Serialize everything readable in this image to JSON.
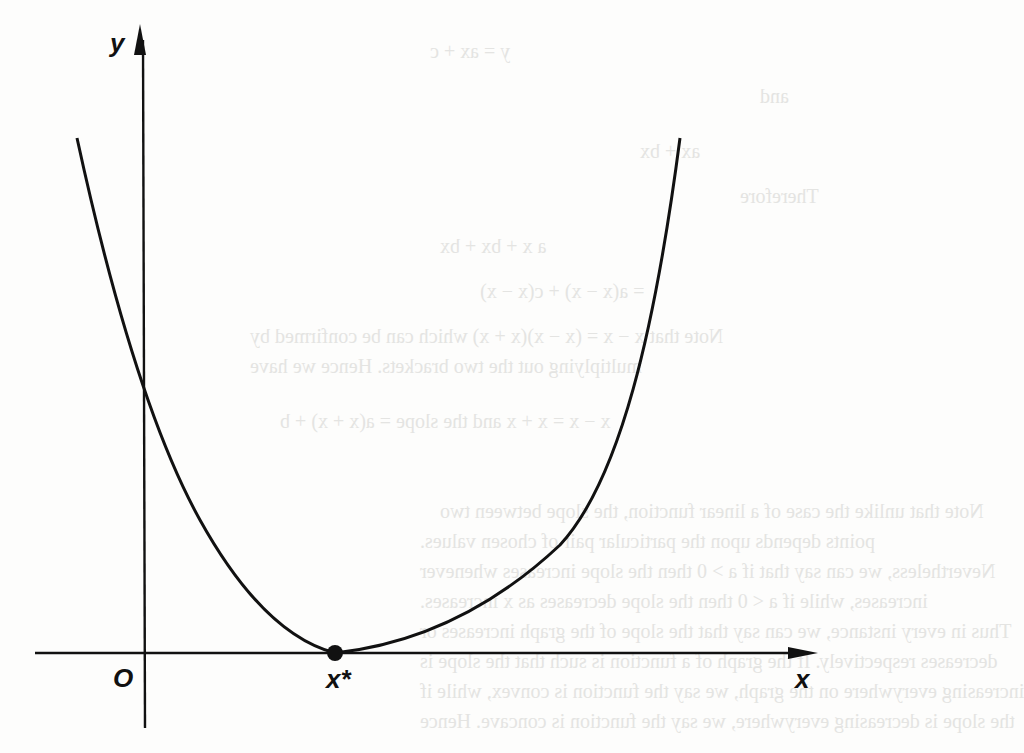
{
  "figure": {
    "type": "convex-function-minimum-diagram",
    "axes": {
      "x_label": "x",
      "y_label": "y",
      "origin_label": "O"
    },
    "curve": {
      "shape": "convex parabola",
      "description": "U-shaped curve with minimum touching the x-axis"
    },
    "point": {
      "label": "x*",
      "marker": "filled-circle"
    },
    "colors": {
      "ink": "#111111",
      "paper": "#fdfdfc",
      "bleed_through": "#e4e4e2"
    }
  }
}
